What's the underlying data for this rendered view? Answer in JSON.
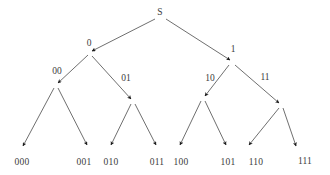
{
  "diagram": {
    "type": "binary-tree",
    "background_color": "#ffffff",
    "edge_color": "#4a4a4a",
    "arrow_color": "#1a1a1a",
    "text_color": "#3c3c3c",
    "nodes": [
      {
        "id": "root",
        "label": "S",
        "x": 160,
        "y": 13,
        "point_x": 160,
        "point_y": 20,
        "depth": 0
      },
      {
        "id": "n0",
        "label": "0",
        "x": 89,
        "y": 44,
        "point_x": 90,
        "point_y": 53,
        "depth": 1
      },
      {
        "id": "n1",
        "label": "1",
        "x": 233,
        "y": 50,
        "point_x": 232,
        "point_y": 62,
        "depth": 1
      },
      {
        "id": "n00",
        "label": "00",
        "x": 57,
        "y": 72,
        "point_x": 56,
        "point_y": 85,
        "depth": 2
      },
      {
        "id": "n01",
        "label": "01",
        "x": 126,
        "y": 79,
        "point_x": 133,
        "point_y": 101,
        "depth": 2
      },
      {
        "id": "n10",
        "label": "10",
        "x": 210,
        "y": 79,
        "point_x": 203,
        "point_y": 98,
        "depth": 2
      },
      {
        "id": "n11",
        "label": "11",
        "x": 265,
        "y": 78,
        "point_x": 281,
        "point_y": 105,
        "depth": 2
      }
    ],
    "leaves": [
      {
        "id": "l000",
        "label": "000",
        "x": 22,
        "y": 163,
        "tip_x": 22,
        "tip_y": 148
      },
      {
        "id": "l001",
        "label": "001",
        "x": 84,
        "y": 163,
        "tip_x": 88,
        "tip_y": 147
      },
      {
        "id": "l010",
        "label": "010",
        "x": 111,
        "y": 163,
        "tip_x": 110,
        "tip_y": 147
      },
      {
        "id": "l011",
        "label": "011",
        "x": 157,
        "y": 163,
        "tip_x": 157,
        "tip_y": 147
      },
      {
        "id": "l100",
        "label": "100",
        "x": 181,
        "y": 163,
        "tip_x": 179,
        "tip_y": 147
      },
      {
        "id": "l101",
        "label": "101",
        "x": 228,
        "y": 163,
        "tip_x": 227,
        "tip_y": 147
      },
      {
        "id": "l110",
        "label": "110",
        "x": 256,
        "y": 163,
        "tip_x": 248,
        "tip_y": 147
      },
      {
        "id": "l111",
        "label": "111",
        "x": 305,
        "y": 162,
        "tip_x": 297,
        "tip_y": 148
      }
    ],
    "edges": [
      {
        "from": "root",
        "to": "n0",
        "x1": 155,
        "y1": 19,
        "x2": 92,
        "y2": 51
      },
      {
        "from": "root",
        "to": "n1",
        "x1": 166,
        "y1": 19,
        "x2": 230,
        "y2": 60
      },
      {
        "from": "n0",
        "to": "n00",
        "x1": 88,
        "y1": 55,
        "x2": 58,
        "y2": 83
      },
      {
        "from": "n0",
        "to": "n01",
        "x1": 92,
        "y1": 56,
        "x2": 131,
        "y2": 99
      },
      {
        "from": "n1",
        "to": "n10",
        "x1": 229,
        "y1": 65,
        "x2": 205,
        "y2": 96
      },
      {
        "from": "n1",
        "to": "n11",
        "x1": 235,
        "y1": 65,
        "x2": 279,
        "y2": 103
      },
      {
        "from": "n00",
        "to": "l000",
        "x1": 54,
        "y1": 88,
        "x2": 23,
        "y2": 146
      },
      {
        "from": "n00",
        "to": "l001",
        "x1": 58,
        "y1": 88,
        "x2": 87,
        "y2": 145
      },
      {
        "from": "n01",
        "to": "l010",
        "x1": 131,
        "y1": 104,
        "x2": 111,
        "y2": 145
      },
      {
        "from": "n01",
        "to": "l011",
        "x1": 135,
        "y1": 104,
        "x2": 156,
        "y2": 145
      },
      {
        "from": "n10",
        "to": "l100",
        "x1": 201,
        "y1": 101,
        "x2": 180,
        "y2": 145
      },
      {
        "from": "n10",
        "to": "l101",
        "x1": 205,
        "y1": 101,
        "x2": 226,
        "y2": 145
      },
      {
        "from": "n11",
        "to": "l110",
        "x1": 279,
        "y1": 108,
        "x2": 249,
        "y2": 145
      },
      {
        "from": "n11",
        "to": "l111",
        "x1": 283,
        "y1": 108,
        "x2": 296,
        "y2": 146
      }
    ]
  }
}
